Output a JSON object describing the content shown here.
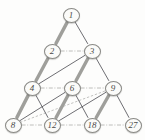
{
  "figure": {
    "background_color": "#fdfdfc",
    "node_fill": "#fbfbf9",
    "node_stroke": "#8a8a86",
    "thick_edge_color": "#9a9a96",
    "thin_edge_color": "#55555a",
    "dashdot_edge_color": "#a0a09c"
  },
  "chart_data": {
    "type": "diagram",
    "nodes": [
      {
        "id": "n1",
        "label": "1",
        "x": 71,
        "y": 15,
        "row": 0,
        "col": 0
      },
      {
        "id": "n2",
        "label": "2",
        "x": 52,
        "y": 51,
        "row": 1,
        "col": 0
      },
      {
        "id": "n3",
        "label": "3",
        "x": 92,
        "y": 51,
        "row": 1,
        "col": 1
      },
      {
        "id": "n4",
        "label": "4",
        "x": 32,
        "y": 88,
        "row": 2,
        "col": 0
      },
      {
        "id": "n6",
        "label": "6",
        "x": 72,
        "y": 88,
        "row": 2,
        "col": 1
      },
      {
        "id": "n9",
        "label": "9",
        "x": 113,
        "y": 88,
        "row": 2,
        "col": 2
      },
      {
        "id": "n8",
        "label": "8",
        "x": 13,
        "y": 125,
        "row": 3,
        "col": 0
      },
      {
        "id": "n12",
        "label": "12",
        "x": 52,
        "y": 125,
        "row": 3,
        "col": 1
      },
      {
        "id": "n18",
        "label": "18",
        "x": 92,
        "y": 125,
        "row": 3,
        "col": 2
      },
      {
        "id": "n27",
        "label": "27",
        "x": 133,
        "y": 125,
        "row": 3,
        "col": 3
      }
    ],
    "edges": [
      {
        "from": "n1",
        "to": "n2",
        "style": "thick"
      },
      {
        "from": "n1",
        "to": "n3",
        "style": "thin"
      },
      {
        "from": "n2",
        "to": "n4",
        "style": "thick"
      },
      {
        "from": "n2",
        "to": "n3",
        "style": "dashdot"
      },
      {
        "from": "n3",
        "to": "n6",
        "style": "thick"
      },
      {
        "from": "n3",
        "to": "n9",
        "style": "thin"
      },
      {
        "from": "n3",
        "to": "n4",
        "style": "thin"
      },
      {
        "from": "n4",
        "to": "n8",
        "style": "thick"
      },
      {
        "from": "n4",
        "to": "n6",
        "style": "dashdot"
      },
      {
        "from": "n4",
        "to": "n12",
        "style": "thin"
      },
      {
        "from": "n6",
        "to": "n9",
        "style": "dashdot"
      },
      {
        "from": "n6",
        "to": "n12",
        "style": "thick"
      },
      {
        "from": "n6",
        "to": "n18",
        "style": "thin"
      },
      {
        "from": "n6",
        "to": "n8",
        "style": "thin"
      },
      {
        "from": "n9",
        "to": "n18",
        "style": "thick"
      },
      {
        "from": "n9",
        "to": "n27",
        "style": "thin"
      },
      {
        "from": "n9",
        "to": "n12",
        "style": "thin"
      },
      {
        "from": "n9",
        "to": "n8",
        "style": "dashed"
      },
      {
        "from": "n8",
        "to": "n12",
        "style": "dashdot"
      },
      {
        "from": "n12",
        "to": "n18",
        "style": "dashdot"
      },
      {
        "from": "n18",
        "to": "n27",
        "style": "dashdot"
      }
    ]
  }
}
